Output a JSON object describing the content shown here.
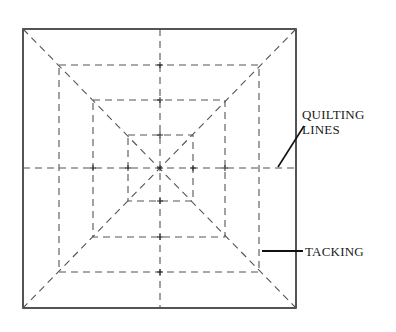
{
  "diagram": {
    "labels": {
      "quilting_line1": "QUILTING",
      "quilting_line2": "LINES",
      "tacking": "TACKING"
    },
    "colors": {
      "outline": "#2a2a2a",
      "dashed": "#555555",
      "background": "#ffffff"
    }
  }
}
